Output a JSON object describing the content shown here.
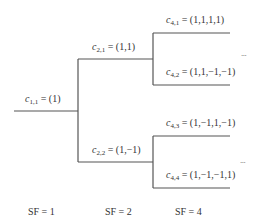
{
  "diagram": {
    "type": "ovsf-code-tree",
    "line_color": "#555555",
    "text_color": "#333333",
    "nodes": [
      {
        "id": "c11",
        "symbol": "c",
        "subscript": "1,1",
        "equals": "= (1)"
      },
      {
        "id": "c21",
        "symbol": "c",
        "subscript": "2,1",
        "equals": "= (1,1)"
      },
      {
        "id": "c22",
        "symbol": "c",
        "subscript": "2,2",
        "equals": "= (1,−1)"
      },
      {
        "id": "c41",
        "symbol": "c",
        "subscript": "4,1",
        "equals": "= (1,1,1,1)"
      },
      {
        "id": "c42",
        "symbol": "c",
        "subscript": "4,2",
        "equals": "= (1,1,−1,−1)"
      },
      {
        "id": "c43",
        "symbol": "c",
        "subscript": "4,3",
        "equals": "= (1,−1,1,−1)"
      },
      {
        "id": "c44",
        "symbol": "c",
        "subscript": "4,4",
        "equals": "= (1,−1,−1,1)"
      }
    ],
    "ellipsis": "...",
    "spreading_factors": [
      {
        "label": "SF = 1"
      },
      {
        "label": "SF = 2"
      },
      {
        "label": "SF = 4"
      }
    ]
  }
}
